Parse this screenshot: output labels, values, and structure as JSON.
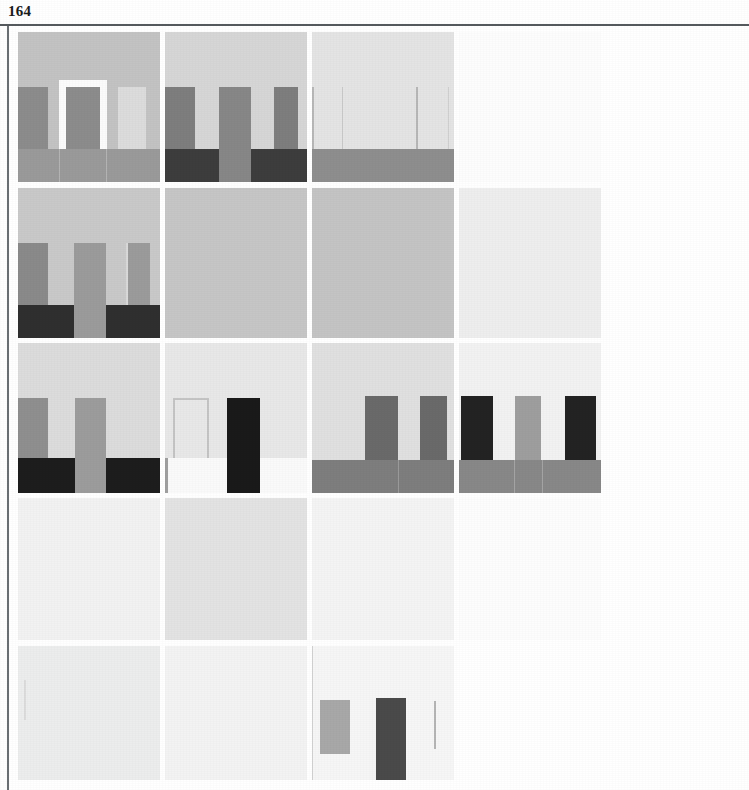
{
  "page": {
    "number": "164",
    "background_color": "#ffffff",
    "frame_rule_color": "#555a5e"
  },
  "plate_grid": {
    "type": "image-grid",
    "columns": 4,
    "rows": 5,
    "column_x": [
      0,
      147,
      294,
      441
    ],
    "column_widths": [
      142,
      142,
      142,
      142
    ],
    "row_y": [
      0,
      156,
      311,
      466,
      614
    ],
    "row_heights": [
      150,
      150,
      150,
      142,
      134
    ],
    "cells": [
      {
        "id": "r0c0",
        "label": "composition-doorway-with-flanking-panels",
        "field_color": "#c3c3c3",
        "shapes": [
          {
            "name": "left-panel",
            "kind": "rect",
            "color": "#8c8c8c",
            "x": 0,
            "y": 55,
            "w": 30,
            "h": 62
          },
          {
            "name": "doorway-frame",
            "kind": "rect",
            "color": "#fbfbfb",
            "x": 41,
            "y": 48,
            "w": 48,
            "h": 78
          },
          {
            "name": "doorway-infill",
            "kind": "rect",
            "color": "#8c8c8c",
            "x": 48,
            "y": 55,
            "w": 34,
            "h": 75
          },
          {
            "name": "right-light-panel",
            "kind": "rect",
            "color": "#dcdcdc",
            "x": 100,
            "y": 55,
            "w": 28,
            "h": 62
          },
          {
            "name": "base-band",
            "kind": "rect",
            "color": "#9a9a9a",
            "x": 0,
            "y": 117,
            "w": 142,
            "h": 33
          },
          {
            "name": "base-seam-left",
            "kind": "rect",
            "color": "#b4b4b4",
            "x": 41,
            "y": 117,
            "w": 1,
            "h": 33
          },
          {
            "name": "base-seam-right",
            "kind": "rect",
            "color": "#b4b4b4",
            "x": 88,
            "y": 117,
            "w": 1,
            "h": 33
          }
        ]
      },
      {
        "id": "r0c1",
        "label": "composition-three-piers-split-dark-base",
        "field_color": "#d6d6d6",
        "shapes": [
          {
            "name": "pier-left",
            "kind": "rect",
            "color": "#7e7e7e",
            "x": 0,
            "y": 55,
            "w": 30,
            "h": 62
          },
          {
            "name": "pier-center",
            "kind": "rect",
            "color": "#878787",
            "x": 54,
            "y": 55,
            "w": 32,
            "h": 95
          },
          {
            "name": "pier-right",
            "kind": "rect",
            "color": "#7e7e7e",
            "x": 109,
            "y": 55,
            "w": 24,
            "h": 62
          },
          {
            "name": "base-left",
            "kind": "rect",
            "color": "#3d3d3d",
            "x": 0,
            "y": 117,
            "w": 54,
            "h": 33
          },
          {
            "name": "base-right",
            "kind": "rect",
            "color": "#3d3d3d",
            "x": 86,
            "y": 117,
            "w": 56,
            "h": 33
          }
        ]
      },
      {
        "id": "r0c2",
        "label": "composition-faint-outlines-gray-base",
        "field_color": "#e4e4e4",
        "shapes": [
          {
            "name": "outline-left-edge",
            "kind": "rect",
            "color": "#b7b7b7",
            "x": 0,
            "y": 55,
            "w": 2,
            "h": 62
          },
          {
            "name": "outline-left-right",
            "kind": "rect",
            "color": "#c9c9c9",
            "x": 30,
            "y": 55,
            "w": 1,
            "h": 62
          },
          {
            "name": "outline-mid-edge",
            "kind": "rect",
            "color": "#b7b7b7",
            "x": 104,
            "y": 55,
            "w": 2,
            "h": 62
          },
          {
            "name": "outline-right-edge",
            "kind": "rect",
            "color": "#cfcfcf",
            "x": 136,
            "y": 55,
            "w": 1,
            "h": 62
          },
          {
            "name": "base-band",
            "kind": "rect",
            "color": "#8e8e8e",
            "x": 0,
            "y": 117,
            "w": 142,
            "h": 33
          }
        ]
      },
      {
        "id": "r0c3",
        "label": "composition-blank-white",
        "field_color": "#fdfdfd",
        "shapes": []
      },
      {
        "id": "r1c0",
        "label": "composition-three-piers-dark-base",
        "field_color": "#c9c9c9",
        "shapes": [
          {
            "name": "pier-left",
            "kind": "rect",
            "color": "#8a8a8a",
            "x": 0,
            "y": 55,
            "w": 30,
            "h": 62
          },
          {
            "name": "pier-center",
            "kind": "rect",
            "color": "#9b9b9b",
            "x": 56,
            "y": 55,
            "w": 32,
            "h": 95
          },
          {
            "name": "pier-right",
            "kind": "rect",
            "color": "#9b9b9b",
            "x": 108,
            "y": 55,
            "w": 24,
            "h": 62
          },
          {
            "name": "pier-right-edge",
            "kind": "rect",
            "color": "#dadada",
            "x": 108,
            "y": 55,
            "w": 2,
            "h": 62
          },
          {
            "name": "base-left",
            "kind": "rect",
            "color": "#2f2f2f",
            "x": 0,
            "y": 117,
            "w": 56,
            "h": 33
          },
          {
            "name": "base-right",
            "kind": "rect",
            "color": "#2f2f2f",
            "x": 88,
            "y": 117,
            "w": 54,
            "h": 33
          }
        ]
      },
      {
        "id": "r1c1",
        "label": "composition-flat-gray-field",
        "field_color": "#c6c6c6",
        "shapes": []
      },
      {
        "id": "r1c2",
        "label": "composition-flat-medium-gray-field",
        "field_color": "#c4c4c4",
        "shapes": []
      },
      {
        "id": "r1c3",
        "label": "composition-flat-pale-field",
        "field_color": "#eeeeee",
        "shapes": []
      },
      {
        "id": "r2c0",
        "label": "composition-two-piers-black-base",
        "field_color": "#dcdcdc",
        "shapes": [
          {
            "name": "pier-left",
            "kind": "rect",
            "color": "#8f8f8f",
            "x": 0,
            "y": 55,
            "w": 30,
            "h": 62
          },
          {
            "name": "pier-center",
            "kind": "rect",
            "color": "#9c9c9c",
            "x": 57,
            "y": 55,
            "w": 31,
            "h": 95
          },
          {
            "name": "base-left",
            "kind": "rect",
            "color": "#1d1d1d",
            "x": 0,
            "y": 115,
            "w": 57,
            "h": 35
          },
          {
            "name": "base-right",
            "kind": "rect",
            "color": "#1d1d1d",
            "x": 88,
            "y": 115,
            "w": 54,
            "h": 35
          }
        ]
      },
      {
        "id": "r2c1",
        "label": "composition-outline-panel-and-black-pier",
        "field_color": "#e8e8e8",
        "shapes": [
          {
            "name": "outline-panel",
            "kind": "outline",
            "color": "#c4c4c4",
            "x": 8,
            "y": 55,
            "w": 36,
            "h": 62
          },
          {
            "name": "pier-black",
            "kind": "rect",
            "color": "#1a1a1a",
            "x": 62,
            "y": 55,
            "w": 33,
            "h": 95
          },
          {
            "name": "lower-white-band",
            "kind": "rect",
            "color": "#fafafa",
            "x": 0,
            "y": 115,
            "w": 142,
            "h": 35
          },
          {
            "name": "pier-black-foot",
            "kind": "rect",
            "color": "#1a1a1a",
            "x": 62,
            "y": 115,
            "w": 33,
            "h": 35
          },
          {
            "name": "left-edge-tick",
            "kind": "rect",
            "color": "#9f9f9f",
            "x": 0,
            "y": 115,
            "w": 3,
            "h": 35
          }
        ]
      },
      {
        "id": "r2c2",
        "label": "composition-two-dark-piers-on-gray-plinth",
        "field_color": "#e0e0e0",
        "shapes": [
          {
            "name": "pier-center",
            "kind": "rect",
            "color": "#6a6a6a",
            "x": 53,
            "y": 53,
            "w": 33,
            "h": 97
          },
          {
            "name": "pier-right",
            "kind": "rect",
            "color": "#6a6a6a",
            "x": 108,
            "y": 53,
            "w": 27,
            "h": 64
          },
          {
            "name": "plinth",
            "kind": "rect",
            "color": "#7e7e7e",
            "x": 0,
            "y": 117,
            "w": 142,
            "h": 33
          },
          {
            "name": "plinth-seam",
            "kind": "rect",
            "color": "#9a9a9a",
            "x": 86,
            "y": 117,
            "w": 1,
            "h": 33
          }
        ]
      },
      {
        "id": "r2c3",
        "label": "composition-black-piers-flanking-gray-pier",
        "field_color": "#f2f2f2",
        "shapes": [
          {
            "name": "pier-black-left",
            "kind": "rect",
            "color": "#232323",
            "x": 2,
            "y": 53,
            "w": 32,
            "h": 64
          },
          {
            "name": "pier-gray-center",
            "kind": "rect",
            "color": "#9e9e9e",
            "x": 56,
            "y": 53,
            "w": 26,
            "h": 97
          },
          {
            "name": "pier-black-right",
            "kind": "rect",
            "color": "#232323",
            "x": 106,
            "y": 53,
            "w": 31,
            "h": 64
          },
          {
            "name": "plinth",
            "kind": "rect",
            "color": "#888888",
            "x": 0,
            "y": 117,
            "w": 142,
            "h": 33
          },
          {
            "name": "plinth-seam-left",
            "kind": "rect",
            "color": "#a4a4a4",
            "x": 55,
            "y": 117,
            "w": 1,
            "h": 33
          },
          {
            "name": "plinth-seam-right",
            "kind": "rect",
            "color": "#a4a4a4",
            "x": 83,
            "y": 117,
            "w": 1,
            "h": 33
          }
        ]
      },
      {
        "id": "r3c0",
        "label": "composition-blank-pale-field",
        "field_color": "#f2f2f2",
        "shapes": []
      },
      {
        "id": "r3c1",
        "label": "composition-flat-light-gray-field",
        "field_color": "#e3e3e3",
        "shapes": []
      },
      {
        "id": "r3c2",
        "label": "composition-blank-very-pale-field",
        "field_color": "#f4f4f4",
        "shapes": []
      },
      {
        "id": "r3c3",
        "label": "composition-blank-white",
        "field_color": "#fdfdfd",
        "shapes": []
      },
      {
        "id": "r4c0",
        "label": "composition-blank-pale-field-with-faint-mark",
        "field_color": "#eceded",
        "shapes": [
          {
            "name": "faint-curve-mark",
            "kind": "rect",
            "color": "#dcdcdc",
            "x": 6,
            "y": 34,
            "w": 2,
            "h": 40
          }
        ]
      },
      {
        "id": "r4c1",
        "label": "composition-blank-very-pale-field",
        "field_color": "#f3f3f3",
        "shapes": []
      },
      {
        "id": "r4c2",
        "label": "composition-gray-panel-dark-pier-thin-line",
        "field_color": "#f6f6f6",
        "shapes": [
          {
            "name": "left-edge-rule",
            "kind": "rect",
            "color": "#d2d2d2",
            "x": 0,
            "y": 0,
            "w": 1,
            "h": 134
          },
          {
            "name": "gray-panel",
            "kind": "rect",
            "color": "#a8a8a8",
            "x": 8,
            "y": 54,
            "w": 30,
            "h": 54
          },
          {
            "name": "dark-pier",
            "kind": "rect",
            "color": "#4a4a4a",
            "x": 64,
            "y": 52,
            "w": 30,
            "h": 82
          },
          {
            "name": "thin-line",
            "kind": "rect",
            "color": "#b5b5b5",
            "x": 122,
            "y": 55,
            "w": 2,
            "h": 48
          }
        ]
      },
      {
        "id": "r4c3",
        "label": "composition-blank-white",
        "field_color": "#ffffff",
        "shapes": []
      }
    ]
  }
}
